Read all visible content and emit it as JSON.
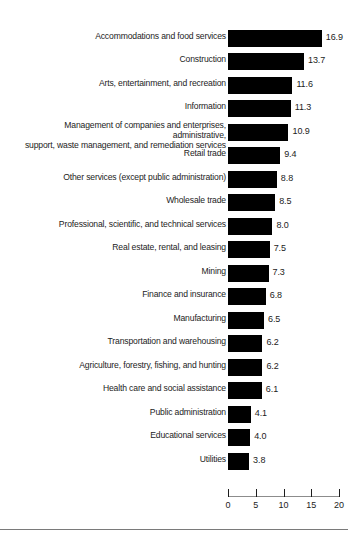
{
  "chart_data": {
    "type": "bar",
    "orientation": "horizontal",
    "title": "",
    "subtitle": "",
    "xlabel": "",
    "ylabel": "",
    "xlim": [
      0,
      20
    ],
    "xticks": [
      "0",
      "5",
      "10",
      "15",
      "20"
    ],
    "grid": false,
    "legend": null,
    "bar_color": "#000000",
    "categories": [
      "Accommodations and food services",
      "Construction",
      "Arts, entertainment, and recreation",
      "Information",
      "Management of companies and enterprises, administrative,\nsupport, waste management, and remediation services",
      "Retail trade",
      "Other services (except public administration)",
      "Wholesale trade",
      "Professional, scientific, and technical services",
      "Real estate, rental, and leasing",
      "Mining",
      "Finance and insurance",
      "Manufacturing",
      "Transportation and warehousing",
      "Agriculture, forestry, fishing, and hunting",
      "Health care and social assistance",
      "Public administration",
      "Educational services",
      "Utilities"
    ],
    "values": [
      16.9,
      13.7,
      11.6,
      11.3,
      10.9,
      9.4,
      8.8,
      8.5,
      8.0,
      7.5,
      7.3,
      6.8,
      6.5,
      6.2,
      6.2,
      6.1,
      4.1,
      4.0,
      3.8
    ],
    "value_labels": [
      "16.9",
      "13.7",
      "11.6",
      "11.3",
      "10.9",
      "9.4",
      "8.8",
      "8.5",
      "8.0",
      "7.5",
      "7.3",
      "6.8",
      "6.5",
      "6.2",
      "6.2",
      "6.1",
      "4.1",
      "4.0",
      "3.8"
    ]
  }
}
